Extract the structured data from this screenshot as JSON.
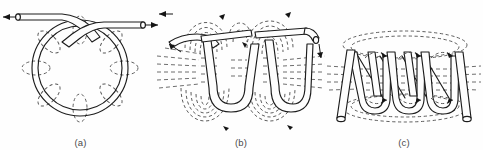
{
  "figure": {
    "background_color": "#fefefe",
    "conductor_color": "#1c1c1c",
    "field_line_color": "#555555",
    "caption_color": "#4a4a4a",
    "width": 483,
    "height": 150
  },
  "panels": [
    {
      "id": "a",
      "label": "(a)",
      "subject": "single circular current loop with crossed leads",
      "conductor_turns": 1,
      "field_loop_count": 8,
      "lead_arrows": [
        {
          "name": "left-lead-arrow",
          "direction": "left"
        },
        {
          "name": "right-lead-arrow",
          "direction": "right"
        }
      ]
    },
    {
      "id": "b",
      "label": "(b)",
      "subject": "two-turn helical coil with concentric field lines",
      "conductor_turns": 2,
      "field_loop_count": 24,
      "lead_arrows": [
        {
          "name": "left-lead-arrow",
          "direction": "left"
        },
        {
          "name": "right-lead-arrow",
          "direction": "down-right"
        }
      ]
    },
    {
      "id": "c",
      "label": "(c)",
      "subject": "multi-turn solenoid with axial field lines",
      "conductor_turns": 5,
      "field_loop_count": 10,
      "lead_arrows": []
    }
  ]
}
